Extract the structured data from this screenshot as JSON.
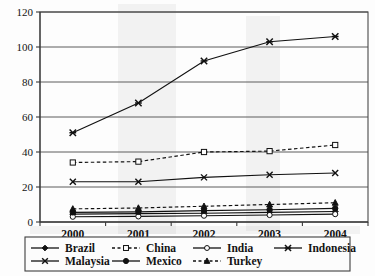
{
  "chart_data": {
    "type": "line",
    "title": "",
    "subtitle": "",
    "xlabel": "",
    "ylabel": "",
    "categories": [
      "2000",
      "2001",
      "2002",
      "2003",
      "2004"
    ],
    "x": [
      2000,
      2001,
      2002,
      2003,
      2004
    ],
    "ylim": [
      0,
      120
    ],
    "y_ticks": [
      0,
      20,
      40,
      60,
      80,
      100,
      120
    ],
    "y_tick_labels": [
      "0",
      "20",
      "40",
      "60",
      "80",
      "100",
      "120"
    ],
    "grid": true,
    "grid_axis": "y",
    "legend_position": "bottom",
    "legend_columns": 4,
    "series": [
      {
        "name": "Brazil",
        "values": [
          4.5,
          4.8,
          5.0,
          5.5,
          6.0
        ],
        "marker": "diamond-filled",
        "linestyle": "solid",
        "color": "#111111"
      },
      {
        "name": "China",
        "values": [
          34,
          34.5,
          40,
          40.5,
          44
        ],
        "marker": "square-open",
        "linestyle": "dashed",
        "color": "#111111"
      },
      {
        "name": "India",
        "values": [
          3.0,
          3.2,
          3.6,
          4.0,
          4.5
        ],
        "marker": "circle-open",
        "linestyle": "solid",
        "color": "#111111"
      },
      {
        "name": "Indonesia",
        "values": [
          51,
          68,
          92,
          103,
          106
        ],
        "marker": "star-x",
        "linestyle": "solid",
        "color": "#111111"
      },
      {
        "name": "Malaysia",
        "values": [
          23,
          23,
          25.5,
          27,
          28
        ],
        "marker": "x-cross",
        "linestyle": "solid",
        "color": "#111111"
      },
      {
        "name": "Mexico",
        "values": [
          5.5,
          5.8,
          6.5,
          7.0,
          7.8
        ],
        "marker": "circle-filled",
        "linestyle": "solid",
        "color": "#111111"
      },
      {
        "name": "Turkey",
        "values": [
          7.5,
          8.0,
          9.0,
          10.0,
          11.0
        ],
        "marker": "triangle-filled",
        "linestyle": "dashed",
        "color": "#111111"
      }
    ]
  },
  "axes": {
    "y_labels": [
      "120",
      "100",
      "80",
      "60",
      "40",
      "20",
      "0"
    ],
    "x_labels": [
      "2000",
      "2001",
      "2002",
      "2003",
      "2004"
    ]
  },
  "legend": {
    "row1": [
      "Brazil",
      "China",
      "India",
      "Indonesia"
    ],
    "row2": [
      "Malaysia",
      "Mexico",
      "Turkey"
    ],
    "entries": [
      {
        "label": "Brazil",
        "marker": "diamond-filled",
        "linestyle": "solid"
      },
      {
        "label": "China",
        "marker": "square-open",
        "linestyle": "dashed"
      },
      {
        "label": "India",
        "marker": "circle-open",
        "linestyle": "solid"
      },
      {
        "label": "Indonesia",
        "marker": "star-x",
        "linestyle": "solid"
      },
      {
        "label": "Malaysia",
        "marker": "x-cross",
        "linestyle": "solid"
      },
      {
        "label": "Mexico",
        "marker": "circle-filled",
        "linestyle": "solid"
      },
      {
        "label": "Turkey",
        "marker": "triangle-filled",
        "linestyle": "dashed"
      }
    ]
  },
  "colors": {
    "ink": "#111111",
    "grid": "#5d5d5d",
    "frame": "#4a4a4a",
    "background": "#fdfdfd"
  }
}
